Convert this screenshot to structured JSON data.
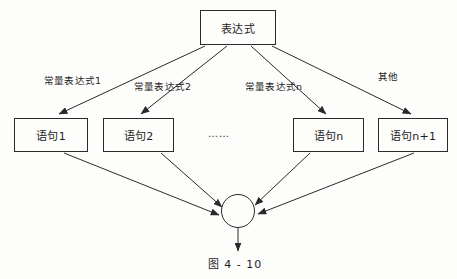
{
  "figure": {
    "caption": "图 4 - 10",
    "background_color": "#fdfdfc",
    "line_color": "#2a2a2a",
    "text_color": "#1d1d1d"
  },
  "nodes": {
    "expression": {
      "label": "表达式"
    },
    "statements": [
      {
        "label": "语句1"
      },
      {
        "label": "语句2"
      },
      {
        "label": "语句n"
      },
      {
        "label": "语句n+1"
      }
    ],
    "merge": {
      "label": ""
    }
  },
  "edge_labels": [
    {
      "label": "常量表达式1"
    },
    {
      "label": "常量表达式2"
    },
    {
      "label": "常量表达式n"
    },
    {
      "label": "其他"
    }
  ],
  "ellipsis": {
    "label": "……"
  }
}
